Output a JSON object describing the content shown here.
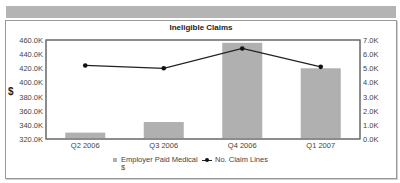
{
  "chart_data": {
    "type": "bar+line",
    "title": "Ineligible Claims",
    "categories": [
      "Q2 2006",
      "Q3 2006",
      "Q4 2006",
      "Q1 2007"
    ],
    "series": [
      {
        "name": "Employer Paid Medical $",
        "type": "bar",
        "axis": "left",
        "color": "#b0b0b0",
        "values": [
          329000,
          344000,
          456000,
          420000
        ]
      },
      {
        "name": "No. Claim Lines",
        "type": "line",
        "axis": "right",
        "color": "#222222",
        "values": [
          5200,
          5000,
          6400,
          5100
        ]
      }
    ],
    "ylabel": "$",
    "ylim_left": [
      320000,
      460000
    ],
    "ylim_right": [
      0,
      7000
    ],
    "left_ticks": [
      "460.0K",
      "440.0K",
      "420.0K",
      "400.0K",
      "380.0K",
      "360.0K",
      "340.0K",
      "320.0K"
    ],
    "right_ticks": [
      "7.0K",
      "6.0K",
      "5.0K",
      "4.0K",
      "3.0K",
      "2.0K",
      "1.0K",
      "0.0K"
    ],
    "grid": false,
    "legend_position": "bottom"
  },
  "legend": {
    "bar_label_line1": "Employer Paid Medical",
    "bar_label_line2": "$",
    "line_label": "No. Claim Lines"
  }
}
